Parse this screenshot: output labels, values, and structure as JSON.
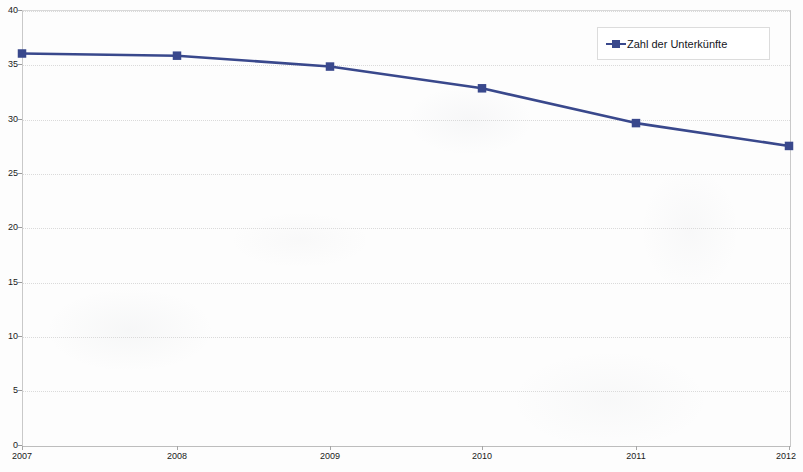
{
  "chart_data": {
    "type": "line",
    "title": "",
    "subtitle": "",
    "xlabel": "",
    "ylabel": "",
    "categories": [
      "2007",
      "2008",
      "2009",
      "2010",
      "2011",
      "2012"
    ],
    "x": [
      2007,
      2008,
      2009,
      2010,
      2011,
      2012
    ],
    "series": [
      {
        "name": "Zahl der Unterkünfte",
        "color": "#39488c",
        "marker": "square",
        "values": [
          36,
          35.8,
          34.8,
          32.8,
          29.6,
          27.5
        ]
      }
    ],
    "ylim": [
      0,
      40
    ],
    "ytick_labels": [
      "0",
      "5",
      "10",
      "15",
      "20",
      "25",
      "30",
      "35",
      "40"
    ],
    "ytick_values": [
      0,
      5,
      10,
      15,
      20,
      25,
      30,
      35,
      40
    ],
    "xtick_labels": [
      "2007",
      "2008",
      "2009",
      "2010",
      "2011",
      "2012"
    ],
    "grid": true,
    "grid_axis": "y",
    "grid_color": "#dadada",
    "legend_position": "top-right",
    "legend_entries": [
      "Zahl der Unterkünfte"
    ],
    "background_color": "#fdfdfd",
    "plot_border_color": "#c9c9c9"
  },
  "legend": {
    "entry_label": "Zahl der Unterkünfte"
  },
  "axes": {
    "y_labels": [
      "40",
      "35",
      "30",
      "25",
      "20",
      "15",
      "10",
      "5",
      "0"
    ],
    "x_labels": [
      "2007",
      "2008",
      "2009",
      "2010",
      "2011",
      "2012"
    ]
  }
}
